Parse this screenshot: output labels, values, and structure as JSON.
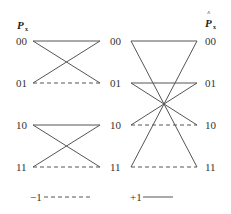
{
  "left_panel": {
    "title": "P",
    "title_sub": "x",
    "rows": [
      "00",
      "01",
      "10",
      "11"
    ]
  },
  "right_panel": {
    "title": "P",
    "title_hat": "^",
    "title_sub": "x",
    "rows": [
      "00",
      "01",
      "10",
      "11"
    ]
  },
  "legend": {
    "negative_label": "−1",
    "positive_label": "+1"
  },
  "colors": {
    "line": "#555555",
    "text": "#333333",
    "background": "#ffffff"
  }
}
